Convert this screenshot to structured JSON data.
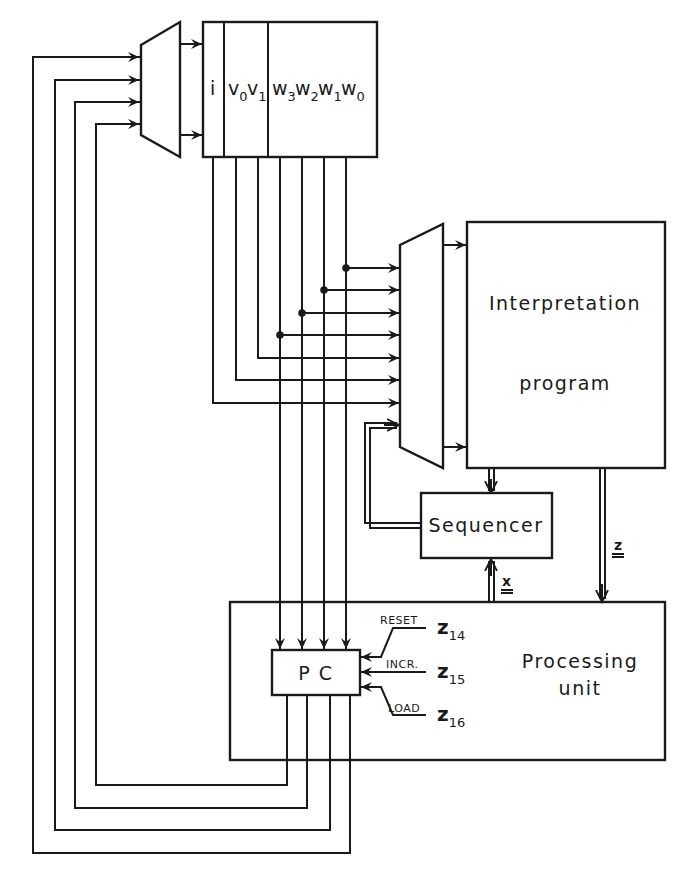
{
  "diagram": {
    "register": {
      "fields": [
        {
          "base": "i",
          "sub": ""
        },
        {
          "base": "v",
          "sub": "0"
        },
        {
          "base": "v",
          "sub": "1"
        },
        {
          "base": "w",
          "sub": "3"
        },
        {
          "base": "w",
          "sub": "2"
        },
        {
          "base": "w",
          "sub": "1"
        },
        {
          "base": "w",
          "sub": "0"
        }
      ]
    },
    "interpretation": {
      "line1": "Interpretation",
      "line2": "program"
    },
    "sequencer": {
      "label": "Sequencer"
    },
    "processing": {
      "line1": "Processing",
      "line2": "unit"
    },
    "pc": {
      "label": "P C"
    },
    "signals": [
      {
        "name": "RESET",
        "z": "z",
        "sub": "14"
      },
      {
        "name": "INCR.",
        "z": "z",
        "sub": "15"
      },
      {
        "name": "LOAD",
        "z": "z",
        "sub": "16"
      }
    ],
    "bus_labels": {
      "x": {
        "text": "x",
        "marks": "≡"
      },
      "z": {
        "text": "z",
        "marks": "≡"
      }
    },
    "colors": {
      "ink": "#1a1a1a",
      "paper": "#ffffff"
    }
  }
}
